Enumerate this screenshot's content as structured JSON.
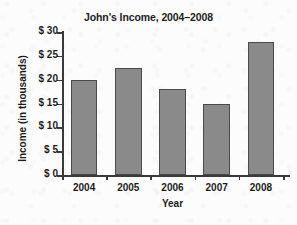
{
  "chart_data": {
    "type": "bar",
    "title": "John's Income, 2004–2008",
    "xlabel": "Year",
    "ylabel": "Income (in thousands)",
    "categories": [
      "2004",
      "2005",
      "2006",
      "2007",
      "2008"
    ],
    "values": [
      20,
      22.5,
      18,
      15,
      28
    ],
    "ylim": [
      0,
      30
    ],
    "ytick_values": [
      0,
      5,
      10,
      15,
      20,
      25,
      30
    ],
    "ytick_labels": [
      "$ 0",
      "$ 5",
      "$ 10",
      "$ 15",
      "$ 20",
      "$ 25",
      "$ 30"
    ],
    "grid": false,
    "legend": false,
    "bar_color": "#8a8a8a",
    "bar_edge_color": "#4a4a4a",
    "axis_color": "#3a3a3a",
    "text_color": "#1c1c1c",
    "background_color": "#fcfcfc"
  }
}
